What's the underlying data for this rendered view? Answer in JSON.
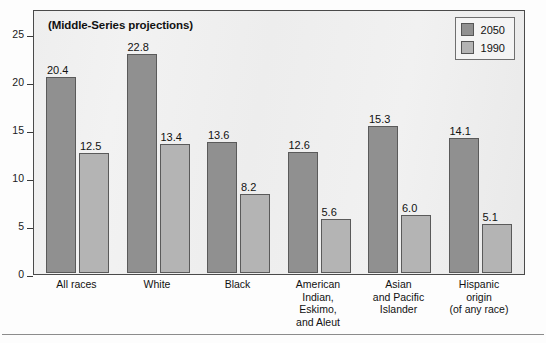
{
  "chart_data": {
    "type": "bar",
    "title": "(Middle-Series projections)",
    "xlabel": "",
    "ylabel": "",
    "ylim": [
      0,
      27.5
    ],
    "yticks": [
      0,
      5,
      10,
      15,
      20,
      25
    ],
    "grid": false,
    "legend_position": "top-right",
    "categories": [
      "All races",
      "White",
      "Black",
      "American Indian, Eskimo, and Aleut",
      "Asian and Pacific Islander",
      "Hispanic origin (of any race)"
    ],
    "category_lines": [
      [
        "All races"
      ],
      [
        "White"
      ],
      [
        "Black"
      ],
      [
        "American",
        "Indian,",
        "Eskimo,",
        "and Aleut"
      ],
      [
        "Asian",
        "and Pacific",
        "Islander"
      ],
      [
        "Hispanic",
        "origin",
        "(of any race)"
      ]
    ],
    "series": [
      {
        "name": "2050",
        "color": "#909090",
        "values": [
          20.4,
          22.8,
          13.6,
          12.6,
          15.3,
          14.1
        ],
        "labels": [
          "20.4",
          "22.8",
          "13.6",
          "12.6",
          "15.3",
          "14.1"
        ]
      },
      {
        "name": "1990",
        "color": "#b4b4b4",
        "values": [
          12.5,
          13.4,
          8.2,
          5.6,
          6.0,
          5.1
        ],
        "labels": [
          "12.5",
          "13.4",
          "8.2",
          "5.6",
          "6.0",
          "5.1"
        ]
      }
    ]
  },
  "legend": {
    "items": [
      {
        "label": "2050",
        "color": "#909090"
      },
      {
        "label": "1990",
        "color": "#b4b4b4"
      }
    ]
  },
  "yaxis": {
    "tick_labels": [
      "25",
      "20",
      "15",
      "10",
      "5",
      "0"
    ]
  }
}
